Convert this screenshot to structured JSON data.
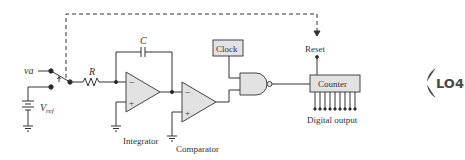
{
  "diagram": {
    "labels": {
      "input": "v",
      "input_sub": "a",
      "reference": "V",
      "reference_sub": "ref",
      "resistor": "R",
      "capacitor": "C",
      "integrator": "Integrator",
      "comparator": "Comparator",
      "clock": "Clock",
      "reset": "Reset",
      "counter": "Counter",
      "digital_output": "Digital output",
      "opamp_minus": "−",
      "opamp_plus": "+"
    },
    "counter_output_lines": 9,
    "badge": {
      "text": "LO4",
      "color": "#4a4a4a"
    },
    "colors": {
      "wire": "#333333",
      "component_fill": "#e2e2e2",
      "component_stroke": "#444444"
    }
  }
}
